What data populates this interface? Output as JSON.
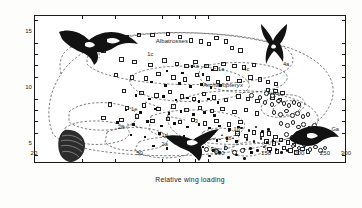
{
  "chart_data": {
    "type": "scatter",
    "title": "",
    "xlabel": "Relative wing loading",
    "ylabel": "Aspect ratio",
    "xscale": "log",
    "xlim": [
      20,
      300
    ],
    "ylim": [
      3.2,
      16.4
    ],
    "grid": false,
    "legend_position": "none",
    "xticks": [
      20,
      50,
      100,
      150,
      200,
      250,
      300
    ],
    "xticklabels": [
      "20",
      "50",
      "100",
      "150",
      "200",
      "250",
      "300"
    ],
    "yticks": [
      5,
      10,
      15
    ],
    "yticklabels": [
      "5",
      "10",
      "15"
    ],
    "y_minor_step": 1,
    "annotations": [
      {
        "text": "Albatrosses",
        "x": 57,
        "y": 14.1
      },
      {
        "text": "Archaeopteryx",
        "x": 86,
        "y": 10.2,
        "style": "italic"
      },
      {
        "text": "Auks",
        "x": 150,
        "y": 9.5
      },
      {
        "text": "Fr",
        "x": 35,
        "y": 13.5
      },
      {
        "text": "Ga",
        "x": 262,
        "y": 6.3
      },
      {
        "text": "Aa",
        "x": 78,
        "y": 11.9
      },
      {
        "text": "1a",
        "x": 98,
        "y": 11.6
      },
      {
        "text": "1b",
        "x": 112,
        "y": 6.3
      },
      {
        "text": "1c",
        "x": 53,
        "y": 13.0
      },
      {
        "text": "1d",
        "x": 60,
        "y": 5.7
      },
      {
        "text": "1e",
        "x": 46,
        "y": 8.1
      },
      {
        "text": "2a",
        "x": 60,
        "y": 4.9
      },
      {
        "text": "2b",
        "x": 41,
        "y": 6.5
      },
      {
        "text": "3",
        "x": 80,
        "y": 7.0
      },
      {
        "text": "4a",
        "x": 172,
        "y": 12.1
      },
      {
        "text": "4b",
        "x": 104,
        "y": 5.5
      },
      {
        "text": "4c",
        "x": 122,
        "y": 11.6
      },
      {
        "text": "Dig",
        "x": 92,
        "y": 4.5
      }
    ],
    "series": [
      {
        "name": "open-square",
        "marker": "open square",
        "points": [
          [
            36,
            13.4
          ],
          [
            44,
            14.6
          ],
          [
            49,
            14.8
          ],
          [
            55,
            14.8
          ],
          [
            63,
            14.9
          ],
          [
            70,
            14.6
          ],
          [
            77,
            14.3
          ],
          [
            84,
            14.2
          ],
          [
            90,
            14.0
          ],
          [
            96,
            14.5
          ],
          [
            104,
            14.2
          ],
          [
            110,
            13.6
          ],
          [
            118,
            13.4
          ],
          [
            42,
            12.6
          ],
          [
            47,
            12.4
          ],
          [
            54,
            12.1
          ],
          [
            61,
            12.5
          ],
          [
            68,
            12.2
          ],
          [
            74,
            12.0
          ],
          [
            80,
            12.4
          ],
          [
            88,
            12.0
          ],
          [
            95,
            11.8
          ],
          [
            102,
            12.2
          ],
          [
            112,
            12.0
          ],
          [
            122,
            11.9
          ],
          [
            133,
            12.1
          ],
          [
            40,
            11.2
          ],
          [
            46,
            11.0
          ],
          [
            52,
            10.9
          ],
          [
            58,
            11.3
          ],
          [
            66,
            11.0
          ],
          [
            73,
            10.8
          ],
          [
            81,
            11.2
          ],
          [
            89,
            10.9
          ],
          [
            97,
            10.6
          ],
          [
            106,
            10.9
          ],
          [
            117,
            10.7
          ],
          [
            129,
            11.0
          ],
          [
            140,
            10.8
          ],
          [
            150,
            10.6
          ],
          [
            161,
            10.4
          ],
          [
            150,
            9.9
          ],
          [
            160,
            9.8
          ],
          [
            170,
            9.6
          ],
          [
            156,
            9.2
          ],
          [
            166,
            9.0
          ],
          [
            43,
            9.8
          ],
          [
            50,
            9.6
          ],
          [
            57,
            9.4
          ],
          [
            64,
            9.7
          ],
          [
            71,
            9.3
          ],
          [
            79,
            9.1
          ],
          [
            86,
            9.5
          ],
          [
            94,
            9.2
          ],
          [
            104,
            9.0
          ],
          [
            116,
            9.3
          ],
          [
            126,
            9.1
          ],
          [
            137,
            8.9
          ],
          [
            38,
            8.6
          ],
          [
            44,
            8.3
          ],
          [
            51,
            8.5
          ],
          [
            58,
            8.2
          ],
          [
            66,
            8.4
          ],
          [
            74,
            8.1
          ],
          [
            83,
            8.3
          ],
          [
            92,
            8.0
          ],
          [
            101,
            8.2
          ],
          [
            112,
            7.9
          ],
          [
            124,
            8.1
          ],
          [
            136,
            7.8
          ],
          [
            36,
            7.4
          ],
          [
            42,
            7.2
          ],
          [
            48,
            7.5
          ],
          [
            55,
            7.1
          ],
          [
            63,
            7.3
          ],
          [
            70,
            7.0
          ],
          [
            78,
            7.2
          ],
          [
            87,
            6.9
          ],
          [
            96,
            7.1
          ],
          [
            107,
            6.8
          ],
          [
            118,
            7.0
          ],
          [
            115,
            6.0
          ],
          [
            124,
            5.8
          ],
          [
            133,
            6.1
          ],
          [
            142,
            5.9
          ],
          [
            151,
            6.0
          ],
          [
            160,
            5.7
          ],
          [
            148,
            5.3
          ],
          [
            158,
            5.1
          ],
          [
            168,
            5.4
          ],
          [
            178,
            5.2
          ],
          [
            188,
            5.0
          ],
          [
            196,
            5.3
          ],
          [
            152,
            4.6
          ],
          [
            162,
            4.4
          ],
          [
            172,
            4.7
          ],
          [
            182,
            4.5
          ],
          [
            192,
            4.3
          ],
          [
            202,
            4.6
          ],
          [
            212,
            4.4
          ]
        ]
      },
      {
        "name": "filled-square",
        "marker": "filled square",
        "points": [
          [
            63,
            11.5
          ],
          [
            72,
            11.3
          ],
          [
            78,
            11.9
          ],
          [
            86,
            11.2
          ],
          [
            93,
            11.6
          ],
          [
            55,
            10.5
          ],
          [
            62,
            10.2
          ],
          [
            70,
            10.4
          ],
          [
            77,
            10.1
          ],
          [
            85,
            10.3
          ],
          [
            92,
            10.0
          ],
          [
            100,
            10.2
          ],
          [
            48,
            9.3
          ],
          [
            54,
            9.0
          ],
          [
            61,
            9.2
          ],
          [
            68,
            8.9
          ],
          [
            75,
            9.1
          ],
          [
            83,
            8.8
          ],
          [
            90,
            9.0
          ],
          [
            98,
            8.7
          ],
          [
            44,
            8.0
          ],
          [
            50,
            7.8
          ],
          [
            57,
            8.1
          ],
          [
            64,
            7.7
          ],
          [
            71,
            7.9
          ],
          [
            79,
            7.6
          ],
          [
            87,
            7.8
          ],
          [
            95,
            7.5
          ],
          [
            41,
            6.9
          ],
          [
            47,
            6.7
          ],
          [
            53,
            7.0
          ],
          [
            60,
            6.6
          ],
          [
            67,
            6.8
          ],
          [
            75,
            6.5
          ],
          [
            83,
            6.7
          ],
          [
            91,
            6.4
          ],
          [
            99,
            6.6
          ],
          [
            108,
            6.3
          ],
          [
            117,
            6.5
          ],
          [
            46,
            5.8
          ],
          [
            52,
            5.6
          ],
          [
            59,
            5.9
          ],
          [
            66,
            5.5
          ],
          [
            73,
            5.7
          ],
          [
            81,
            5.4
          ],
          [
            89,
            5.6
          ],
          [
            97,
            5.3
          ],
          [
            106,
            5.5
          ],
          [
            115,
            5.2
          ],
          [
            56,
            4.8
          ],
          [
            63,
            4.6
          ],
          [
            70,
            4.9
          ],
          [
            78,
            4.5
          ],
          [
            86,
            4.7
          ],
          [
            94,
            4.4
          ],
          [
            104,
            4.6
          ],
          [
            113,
            4.3
          ],
          [
            122,
            4.5
          ],
          [
            131,
            4.2
          ]
        ]
      },
      {
        "name": "open-circle",
        "marker": "open circle",
        "points": [
          [
            130,
            9.4
          ],
          [
            140,
            9.2
          ],
          [
            148,
            9.6
          ],
          [
            156,
            9.4
          ],
          [
            146,
            8.8
          ],
          [
            155,
            8.6
          ],
          [
            164,
            8.9
          ],
          [
            172,
            8.7
          ],
          [
            180,
            8.5
          ],
          [
            188,
            8.8
          ],
          [
            196,
            8.6
          ],
          [
            158,
            7.9
          ],
          [
            167,
            7.7
          ],
          [
            176,
            8.0
          ],
          [
            185,
            7.6
          ],
          [
            194,
            7.8
          ],
          [
            203,
            7.5
          ],
          [
            212,
            7.7
          ],
          [
            168,
            6.9
          ],
          [
            177,
            6.7
          ],
          [
            186,
            7.0
          ],
          [
            195,
            6.6
          ],
          [
            204,
            6.8
          ],
          [
            214,
            6.5
          ],
          [
            224,
            6.7
          ],
          [
            176,
            5.9
          ],
          [
            185,
            5.7
          ],
          [
            194,
            6.0
          ],
          [
            204,
            5.6
          ],
          [
            214,
            5.8
          ],
          [
            224,
            5.5
          ],
          [
            234,
            5.7
          ],
          [
            186,
            4.9
          ],
          [
            196,
            4.7
          ],
          [
            206,
            5.0
          ],
          [
            216,
            4.6
          ],
          [
            226,
            4.8
          ],
          [
            236,
            4.5
          ],
          [
            246,
            4.7
          ],
          [
            88,
            4.6
          ],
          [
            96,
            4.4
          ],
          [
            104,
            4.7
          ],
          [
            112,
            4.3
          ],
          [
            120,
            4.5
          ]
        ]
      },
      {
        "name": "filled-dot",
        "marker": "filled circle",
        "points": [
          [
            120,
            6.4
          ],
          [
            128,
            6.2
          ],
          [
            136,
            6.5
          ],
          [
            144,
            6.1
          ],
          [
            152,
            6.3
          ],
          [
            126,
            5.4
          ],
          [
            134,
            5.2
          ],
          [
            142,
            5.5
          ],
          [
            150,
            5.1
          ],
          [
            158,
            5.3
          ],
          [
            166,
            5.0
          ],
          [
            130,
            4.6
          ],
          [
            138,
            4.4
          ],
          [
            146,
            4.7
          ],
          [
            154,
            4.3
          ],
          [
            162,
            4.5
          ],
          [
            170,
            4.2
          ],
          [
            178,
            4.4
          ],
          [
            83,
            4.1
          ],
          [
            91,
            3.9
          ],
          [
            99,
            4.2
          ],
          [
            107,
            3.8
          ],
          [
            115,
            4.0
          ],
          [
            123,
            3.7
          ]
        ]
      },
      {
        "name": "triangle",
        "marker": "triangle",
        "points": [
          [
            96,
            6.0
          ],
          [
            102,
            5.8
          ],
          [
            108,
            6.1
          ],
          [
            100,
            5.4
          ],
          [
            106,
            5.2
          ],
          [
            112,
            5.5
          ],
          [
            104,
            4.8
          ]
        ]
      }
    ]
  },
  "silhouettes": [
    {
      "name": "frigatebird-silhouette",
      "label": "Fr"
    },
    {
      "name": "swift-silhouette",
      "label": ""
    },
    {
      "name": "gallinule-silhouette",
      "label": "Ga"
    },
    {
      "name": "hummingbird-silhouette",
      "label": ""
    },
    {
      "name": "grouse-silhouette",
      "label": ""
    }
  ]
}
